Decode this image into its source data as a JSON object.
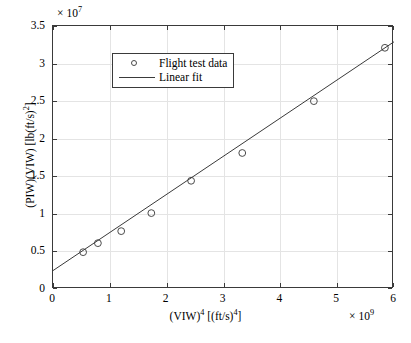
{
  "chart_data": {
    "type": "scatter",
    "title": "",
    "xlabel": "(VIW)4 [(ft/s)4]",
    "ylabel": "(PIW)(VIW) [lb(ft/s)2]",
    "x_exponent_label": "10",
    "x_exponent_power": "9",
    "y_exponent_label": "10",
    "y_exponent_power": "7",
    "x_multiplier_prefix": "× ",
    "y_multiplier_prefix": "× ",
    "xlim": [
      0,
      6
    ],
    "ylim": [
      0,
      3.5
    ],
    "xticks": [
      0,
      1,
      2,
      3,
      4,
      5,
      6
    ],
    "xticklabels": [
      "0",
      "1",
      "2",
      "3",
      "4",
      "5",
      "6"
    ],
    "yticks": [
      0,
      0.5,
      1,
      1.5,
      2,
      2.5,
      3,
      3.5
    ],
    "yticklabels": [
      "0",
      "0.5",
      "1",
      "1.5",
      "2",
      "2.5",
      "3",
      "3.5"
    ],
    "grid": true,
    "grid_color": "#e4e4e4",
    "axis_color": "#3a3a3a",
    "background_color": "#ffffff",
    "legend_position": "top-left",
    "series": [
      {
        "name": "Flight test data",
        "type": "scatter",
        "marker": "circle-open",
        "color": "#4a4a4a",
        "x": [
          0.53,
          0.79,
          1.2,
          1.73,
          2.43,
          3.33,
          4.59,
          5.84
        ],
        "y": [
          0.49,
          0.61,
          0.77,
          1.01,
          1.44,
          1.81,
          2.5,
          3.21
        ]
      },
      {
        "name": "Linear fit",
        "type": "line",
        "color": "#3a3a3a",
        "x": [
          0.0,
          6.0
        ],
        "y": [
          0.245,
          3.29
        ]
      }
    ]
  },
  "legend": {
    "items": [
      {
        "label": "Flight test data",
        "symbol": "circle-open"
      },
      {
        "label": "Linear fit",
        "symbol": "line"
      }
    ]
  }
}
